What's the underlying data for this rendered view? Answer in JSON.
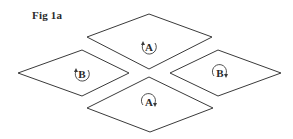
{
  "figure": {
    "label": "Fig 1a",
    "stroke_color": "#3a3a3a",
    "label_color": "#2a2a2a"
  },
  "diamonds": [
    {
      "id": "top",
      "label": "A",
      "rotation": "counterclockwise",
      "points": [
        [
          87,
          37
        ],
        [
          149,
          14
        ],
        [
          212,
          37
        ],
        [
          149,
          69
        ]
      ],
      "center": [
        149,
        47
      ]
    },
    {
      "id": "left",
      "label": "B",
      "rotation": "counterclockwise",
      "points": [
        [
          18,
          73
        ],
        [
          82,
          50
        ],
        [
          129,
          73
        ],
        [
          82,
          96
        ]
      ],
      "center": [
        82,
        74
      ]
    },
    {
      "id": "right",
      "label": "B",
      "rotation": "clockwise",
      "points": [
        [
          170,
          73
        ],
        [
          218,
          50
        ],
        [
          281,
          73
        ],
        [
          218,
          96
        ]
      ],
      "center": [
        220,
        73
      ]
    },
    {
      "id": "bottom",
      "label": "A",
      "rotation": "clockwise",
      "points": [
        [
          87,
          108
        ],
        [
          149,
          77
        ],
        [
          213,
          108
        ],
        [
          150,
          132
        ]
      ],
      "center": [
        149,
        102
      ]
    }
  ]
}
